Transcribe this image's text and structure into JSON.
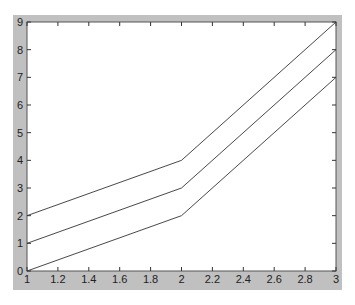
{
  "chart_data": {
    "type": "line",
    "title": "",
    "xlabel": "",
    "ylabel": "",
    "x": [
      1,
      2,
      3
    ],
    "series": [
      {
        "name": "line1",
        "values": [
          0,
          2,
          7
        ],
        "color": "#333333"
      },
      {
        "name": "line2",
        "values": [
          1,
          3,
          8
        ],
        "color": "#333333"
      },
      {
        "name": "line3",
        "values": [
          2,
          4,
          9
        ],
        "color": "#333333"
      }
    ],
    "xlim": [
      1,
      3
    ],
    "ylim": [
      0,
      9
    ],
    "xticks": [
      "1",
      "1.2",
      "1.4",
      "1.6",
      "1.8",
      "2",
      "2.2",
      "2.4",
      "2.6",
      "2.8",
      "3"
    ],
    "yticks": [
      "0",
      "1",
      "2",
      "3",
      "4",
      "5",
      "6",
      "7",
      "8",
      "9"
    ],
    "grid": false,
    "legend": null
  },
  "colors": {
    "figure_background": "#c0c0c0",
    "axes_background": "#ffffff",
    "line": "#333333"
  }
}
